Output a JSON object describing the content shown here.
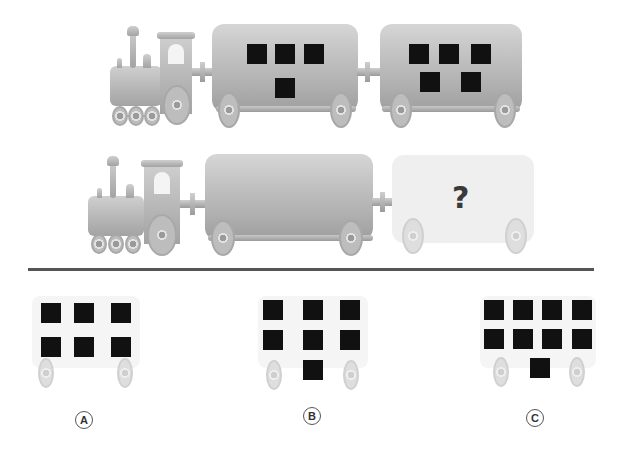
{
  "puzzle": {
    "type": "visual-sequence",
    "description": "Train car pattern puzzle: each car carries black squares; determine which car follows the pattern.",
    "row1": {
      "cars": [
        {
          "squares": 4,
          "layout": "3 top, 1 bottom center"
        },
        {
          "squares": 5,
          "layout": "3 top, 2 bottom"
        }
      ]
    },
    "row2": {
      "cars": [
        {
          "squares": 0,
          "layout": "empty"
        },
        {
          "squares": null,
          "layout": "unknown",
          "label": "?"
        }
      ]
    },
    "question_mark": "?",
    "options": [
      {
        "label": "A",
        "squares": 6,
        "layout": "3 top, 3 middle"
      },
      {
        "label": "B",
        "squares": 7,
        "layout": "3 top, 3 middle, 1 bottom center"
      },
      {
        "label": "C",
        "squares": 9,
        "layout": "4 top, 4 middle, 1 bottom center"
      }
    ]
  },
  "colors": {
    "square": "#111111",
    "car_body": "#c2c2c2",
    "ghost_car": "#efefef",
    "divider": "#555555",
    "background": "#ffffff"
  }
}
